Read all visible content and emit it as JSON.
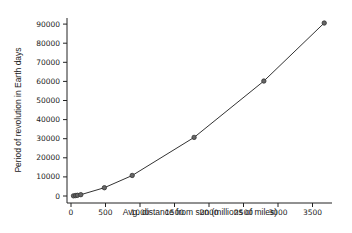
{
  "chart_data": {
    "type": "line",
    "title": "",
    "xlabel": "Avg. distance from sun (millions of miles)",
    "ylabel": "Period of revolution in Earth days",
    "xlim": [
      0,
      3750
    ],
    "ylim": [
      0,
      90000
    ],
    "xticks": [
      0,
      500,
      1000,
      1500,
      2000,
      2500,
      3000,
      3500
    ],
    "yticks": [
      0,
      10000,
      20000,
      30000,
      40000,
      50000,
      60000,
      70000,
      80000,
      90000
    ],
    "grid": false,
    "legend": null,
    "series": [
      {
        "name": "Planets",
        "marker": "circle",
        "x": [
          36,
          67,
          93,
          142,
          484,
          887,
          1784,
          2795,
          3670
        ],
        "y": [
          88,
          225,
          365,
          687,
          4333,
          10759,
          30687,
          60190,
          90560
        ]
      }
    ]
  },
  "colors": {
    "line": "#333333",
    "axis": "#222222",
    "marker": "#333333"
  }
}
